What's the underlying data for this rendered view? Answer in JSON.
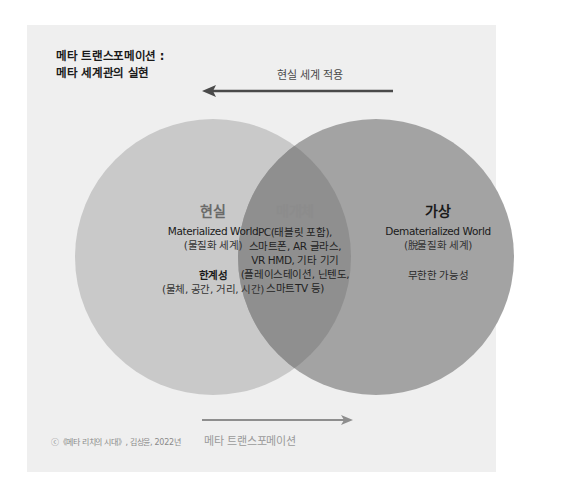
{
  "title": {
    "line1": "메타 트랜스포메이션 :",
    "line2": "메타 세계관의 실현"
  },
  "arrows": {
    "top": {
      "label": "현실 세계 적용",
      "direction": "left",
      "color": "#4a4a4a"
    },
    "bottom": {
      "label": "메타 트랜스포메이션",
      "direction": "right",
      "color": "#8e8e8e"
    }
  },
  "circles": {
    "left": {
      "heading": "현실",
      "english": "Materialized World",
      "korean": "(물질화 세계)",
      "limit_title": "한계성",
      "limit_detail": "(물체, 공간, 거리, 시간)",
      "color": "#c9c9c9"
    },
    "overlap": {
      "heading": "매개체",
      "lines": [
        "PC(태블릿 포함),",
        "스마트폰, AR 글라스,",
        "VR HMD, 기타 기기",
        "(플레이스테이션, 닌텐도,",
        "스마트TV 등)"
      ],
      "color": "#8f8f8f"
    },
    "right": {
      "heading": "가상",
      "english": "Dematerialized World",
      "korean": "(脫물질화 세계)",
      "detail": "무한한 가능성",
      "color": "#a3a3a3"
    }
  },
  "credit": "ⓒ《메타 리치의 시대》, 김상윤, 2022년",
  "colors": {
    "panel": "#efefef",
    "background": "#ffffff"
  }
}
